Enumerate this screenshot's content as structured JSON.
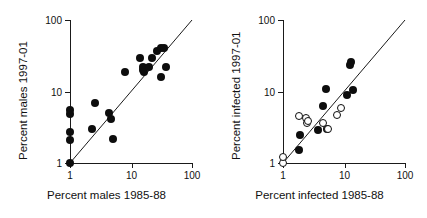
{
  "figure": {
    "background": "#ffffff",
    "marker_filled_color": "#0d0d0d",
    "marker_open_color": "#ffffff",
    "line_color": "#1a1a1a"
  },
  "chart_data": [
    {
      "type": "scatter",
      "panel": "left",
      "title": "",
      "xlabel": "Percent males 1985-88",
      "ylabel": "Percent males 1997-01",
      "xscale": "log",
      "yscale": "log",
      "xlim": [
        1,
        100
      ],
      "ylim": [
        1,
        100
      ],
      "xticks": [
        "1",
        "10",
        "100"
      ],
      "xtick_values": [
        1,
        10,
        100
      ],
      "yticks": [
        "100",
        "10",
        "1"
      ],
      "ytick_values": [
        100,
        10,
        1
      ],
      "grid": false,
      "legend": "none",
      "annotations": [
        "1:1 reference line"
      ],
      "reference_line": {
        "type": "identity",
        "from": [
          1,
          1
        ],
        "to": [
          100,
          100
        ]
      },
      "series": [
        {
          "name": "males",
          "marker": "filled-circle",
          "points": [
            [
              1.0,
              1.0
            ],
            [
              1.0,
              2.1
            ],
            [
              1.0,
              2.7
            ],
            [
              1.0,
              4.8
            ],
            [
              1.0,
              5.5
            ],
            [
              2.3,
              3.0
            ],
            [
              2.6,
              6.8
            ],
            [
              4.4,
              5.0
            ],
            [
              4.7,
              4.1
            ],
            [
              5.0,
              2.2
            ],
            [
              8.0,
              18.5
            ],
            [
              14.0,
              29.0
            ],
            [
              15.5,
              20.0
            ],
            [
              16.0,
              22.0
            ],
            [
              16.5,
              19.0
            ],
            [
              20.0,
              22.0
            ],
            [
              22.0,
              29.0
            ],
            [
              27.0,
              37.0
            ],
            [
              31.0,
              40.0
            ],
            [
              31.0,
              16.0
            ],
            [
              35.0,
              40.0
            ],
            [
              37.0,
              22.0
            ]
          ]
        }
      ]
    },
    {
      "type": "scatter",
      "panel": "right",
      "title": "",
      "xlabel": "Percent infected 1985-88",
      "ylabel": "Percent infected 1997-01",
      "xscale": "log",
      "yscale": "log",
      "xlim": [
        1,
        100
      ],
      "ylim": [
        1,
        100
      ],
      "xticks": [
        "1",
        "10",
        "100"
      ],
      "xtick_values": [
        1,
        10,
        100
      ],
      "yticks": [
        "100",
        "10",
        "1"
      ],
      "ytick_values": [
        100,
        10,
        1
      ],
      "grid": false,
      "legend": "none",
      "annotations": [
        "1:1 reference line"
      ],
      "reference_line": {
        "type": "identity",
        "from": [
          1,
          1
        ],
        "to": [
          100,
          100
        ]
      },
      "series": [
        {
          "name": "infected-filled",
          "marker": "filled-circle",
          "points": [
            [
              1.8,
              1.5
            ],
            [
              1.9,
              2.5
            ],
            [
              3.8,
              2.9
            ],
            [
              4.6,
              6.3
            ],
            [
              5.0,
              10.8
            ],
            [
              5.2,
              3.0
            ],
            [
              11.0,
              8.8
            ],
            [
              12.5,
              23.5
            ],
            [
              13.0,
              26.0
            ],
            [
              14.0,
              10.5
            ]
          ]
        },
        {
          "name": "infected-open",
          "marker": "open-circle",
          "points": [
            [
              1.0,
              1.0
            ],
            [
              1.0,
              1.2
            ],
            [
              1.8,
              4.5
            ],
            [
              2.4,
              4.2
            ],
            [
              2.5,
              3.6
            ],
            [
              2.6,
              3.9
            ],
            [
              4.6,
              3.6
            ],
            [
              5.5,
              3.0
            ],
            [
              7.6,
              4.7
            ],
            [
              9.0,
              5.8
            ]
          ]
        }
      ]
    }
  ]
}
